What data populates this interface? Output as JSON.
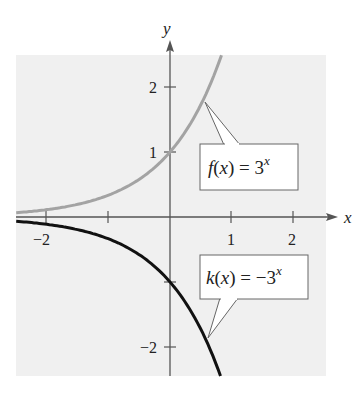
{
  "chart_data": {
    "type": "line",
    "title": "",
    "xlabel": "x",
    "ylabel": "y",
    "xlim": [
      -2.48,
      2.5
    ],
    "ylim": [
      -2.45,
      2.49
    ],
    "grid": false,
    "background": "#f0f0f0",
    "x_ticks": [
      -2,
      -1,
      1,
      2
    ],
    "x_tick_labels": [
      "−2",
      "",
      "1",
      "2"
    ],
    "y_ticks": [
      -2,
      -1,
      1,
      2
    ],
    "y_tick_labels": [
      "−2",
      "",
      "1",
      "2"
    ],
    "series": [
      {
        "name": "f(x) = 3^x",
        "formula": "3^x",
        "color": "#a3a3a3",
        "x": [
          -2.48,
          -2,
          -1.5,
          -1,
          -0.5,
          0,
          0.25,
          0.5,
          0.75,
          0.83
        ],
        "y": [
          0.066,
          0.111,
          0.192,
          0.333,
          0.577,
          1,
          1.316,
          1.732,
          2.28,
          2.49
        ],
        "label": {
          "func": "f",
          "arg": "x",
          "rhs": "3",
          "exp": "x"
        }
      },
      {
        "name": "k(x) = -3^x",
        "formula": "-3^x",
        "color": "#111111",
        "x": [
          -2.48,
          -2,
          -1.5,
          -1,
          -0.5,
          0,
          0.25,
          0.5,
          0.75,
          0.815
        ],
        "y": [
          -0.066,
          -0.111,
          -0.192,
          -0.333,
          -0.577,
          -1,
          -1.316,
          -1.732,
          -2.28,
          -2.45
        ],
        "label": {
          "func": "k",
          "arg": "x",
          "rhs": "−3",
          "exp": "x"
        }
      }
    ]
  },
  "labels": {
    "x_axis": "x",
    "y_axis": "y",
    "x_tick_neg2": "−2",
    "x_tick_1": "1",
    "x_tick_2": "2",
    "y_tick_2": "2",
    "y_tick_1": "1",
    "y_tick_neg2": "−2",
    "f_func": "f",
    "f_paren_open": "(",
    "f_arg": "x",
    "f_paren_close": ") = 3",
    "f_exp": "x",
    "k_func": "k",
    "k_paren_open": "(",
    "k_arg": "x",
    "k_paren_close": ") = −3",
    "k_exp": "x"
  }
}
